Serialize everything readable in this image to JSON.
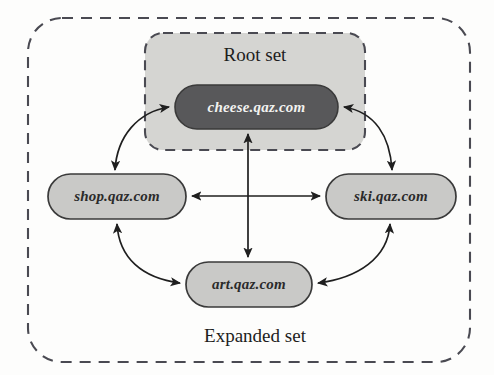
{
  "figure": {
    "colors": {
      "page_background": "#fdfdfc",
      "root_set_fill": "#d5d5d2",
      "root_node_fill": "#58585a",
      "node_fill": "#c9c9c7",
      "node_stroke": "#3a3a3a",
      "dashed_stroke": "#4a4a52",
      "arrow_stroke": "#1f1f1f",
      "dark_node_text": "#f2f2f0",
      "light_node_text": "#2b2b2b",
      "set_label_text": "#1d1d1d"
    }
  },
  "regions": {
    "expanded_set": {
      "label": "Expanded set",
      "style": "dashed-rounded-rectangle",
      "x": 28,
      "y": 18,
      "width": 442,
      "height": 344,
      "radius": 34
    },
    "root_set": {
      "label": "Root set",
      "style": "dashed-rounded-rectangle-filled",
      "x": 145,
      "y": 33,
      "width": 220,
      "height": 117,
      "radius": 18
    }
  },
  "nodes": [
    {
      "id": "cheese",
      "label": "cheese.qaz.com",
      "variant": "root",
      "x": 175,
      "y": 85,
      "width": 163,
      "height": 44
    },
    {
      "id": "shop",
      "label": "shop.qaz.com",
      "variant": "expanded",
      "x": 48,
      "y": 174,
      "width": 138,
      "height": 45
    },
    {
      "id": "ski",
      "label": "ski.qaz.com",
      "variant": "expanded",
      "x": 326,
      "y": 174,
      "width": 130,
      "height": 45
    },
    {
      "id": "art",
      "label": "art.qaz.com",
      "variant": "expanded",
      "x": 186,
      "y": 262,
      "width": 126,
      "height": 45
    }
  ],
  "edges": [
    {
      "id": "cheese-shop",
      "from": "cheese",
      "to": "shop",
      "kind": "curved",
      "direction": "bidirectional"
    },
    {
      "id": "cheese-ski",
      "from": "cheese",
      "to": "ski",
      "kind": "curved",
      "direction": "bidirectional"
    },
    {
      "id": "shop-ski",
      "from": "shop",
      "to": "ski",
      "kind": "straight",
      "direction": "bidirectional"
    },
    {
      "id": "cheese-art",
      "from": "cheese",
      "to": "art",
      "kind": "straight",
      "direction": "bidirectional"
    },
    {
      "id": "shop-art",
      "from": "shop",
      "to": "art",
      "kind": "curved",
      "direction": "bidirectional"
    },
    {
      "id": "ski-art",
      "from": "ski",
      "to": "art",
      "kind": "curved",
      "direction": "bidirectional"
    }
  ]
}
